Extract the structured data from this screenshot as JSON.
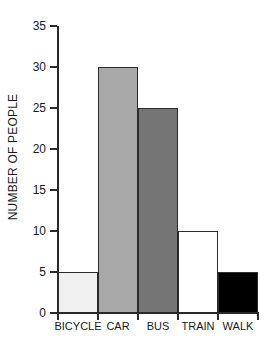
{
  "chart_data": {
    "type": "bar",
    "title": "",
    "xlabel": "",
    "ylabel": "NUMBER OF PEOPLE",
    "categories": [
      "BICYCLE",
      "CAR",
      "BUS",
      "TRAIN",
      "WALK"
    ],
    "values": [
      5,
      30,
      25,
      10,
      5
    ],
    "bar_colors": [
      "#f0f0f0",
      "#a8a8a8",
      "#757575",
      "#ffffff",
      "#000000"
    ],
    "bar_edge_color": "#2b2b2b",
    "ylim": [
      0,
      35
    ],
    "ytick_values": [
      0,
      5,
      10,
      15,
      20,
      25,
      30,
      35
    ],
    "ytick_labels": [
      "0",
      "5",
      "10",
      "15",
      "20",
      "25",
      "30",
      "35"
    ],
    "grid": false,
    "legend": null,
    "axis_color": "#2b2b2b",
    "background_color": "#ffffff",
    "bars": [
      {
        "label": "BICYCLE",
        "value": 5,
        "color": "#f0f0f0"
      },
      {
        "label": "CAR",
        "value": 30,
        "color": "#a8a8a8"
      },
      {
        "label": "BUS",
        "value": 25,
        "color": "#757575"
      },
      {
        "label": "TRAIN",
        "value": 10,
        "color": "#ffffff"
      },
      {
        "label": "WALK",
        "value": 5,
        "color": "#000000"
      }
    ]
  }
}
